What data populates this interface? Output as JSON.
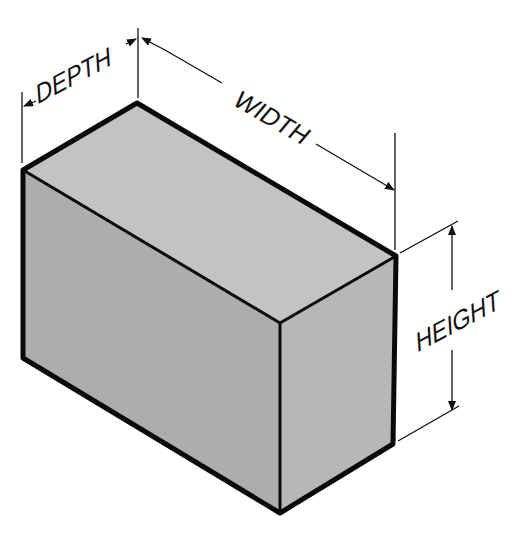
{
  "diagram": {
    "type": "isometric-box-dimensions",
    "labels": {
      "depth": "DEPTH",
      "width": "WIDTH",
      "height": "HEIGHT"
    },
    "colors": {
      "background": "#ffffff",
      "top_face": "#c2c2c2",
      "left_face": "#aeaeae",
      "right_face": "#b8b8b8",
      "edge": "#0a0a0a",
      "dimension_line": "#111111"
    }
  }
}
